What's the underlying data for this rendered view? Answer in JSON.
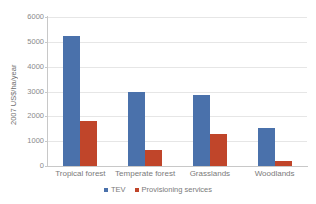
{
  "chart_data": {
    "type": "bar",
    "title": "",
    "xlabel": "",
    "ylabel": "2007 US$/ha/year",
    "ylim": [
      0,
      6000
    ],
    "ytick_labels": [
      "6000",
      "5000",
      "4000",
      "3000",
      "2000",
      "1000",
      "0"
    ],
    "ytick_values": [
      6000,
      5000,
      4000,
      3000,
      2000,
      1000,
      0
    ],
    "grid": true,
    "legend_position": "bottom",
    "categories": [
      "Tropical forest",
      "Temperate forest",
      "Grasslands",
      "Woodlands"
    ],
    "series": [
      {
        "name": "TEV",
        "color": "#4a71ab",
        "values": [
          5250,
          2980,
          2840,
          1550
        ]
      },
      {
        "name": "Provisioning services",
        "color": "#c0452a",
        "values": [
          1800,
          650,
          1270,
          210
        ]
      }
    ]
  },
  "axis": {
    "y_title": "2007 US$/ha/year"
  },
  "colors": {
    "tev": "#4a71ab",
    "provisioning": "#c0452a",
    "gridline": "#e6e6e6",
    "axis": "#c8c8c8",
    "tick_text": "#8a8a8a",
    "background": "#ffffff"
  }
}
